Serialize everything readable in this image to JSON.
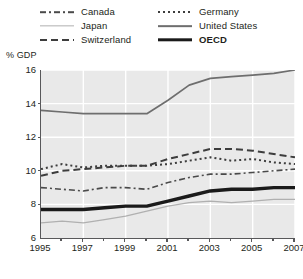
{
  "chart_data": {
    "type": "line",
    "title": "",
    "subtitle": "",
    "xlabel": "",
    "ylabel": "% GDP",
    "ylim": [
      6,
      16
    ],
    "xlim": [
      1995,
      2007
    ],
    "yticks": [
      6,
      8,
      10,
      12,
      14,
      16
    ],
    "xticks": [
      1995,
      1997,
      1999,
      2001,
      2003,
      2005,
      2007
    ],
    "xticks_minor": [
      1996,
      1998,
      2000,
      2002,
      2004,
      2006
    ],
    "grid": true,
    "grid_color": "#ffffff",
    "plot_background": "#e9e9e9",
    "axis_color": "#58585a",
    "legend_position": "top",
    "x": [
      1995,
      1996,
      1997,
      1998,
      1999,
      2000,
      2001,
      2002,
      2003,
      2004,
      2005,
      2006,
      2007
    ],
    "series": [
      {
        "name": "Canada",
        "style": "dash-dot",
        "color": "#4a4a4a",
        "width": 1.6,
        "values": [
          9.0,
          8.9,
          8.8,
          9.0,
          9.0,
          8.9,
          9.3,
          9.6,
          9.8,
          9.8,
          9.9,
          10.0,
          10.1
        ]
      },
      {
        "name": "Japan",
        "style": "solid-thin",
        "color": "#b0b0b0",
        "width": 1.3,
        "values": [
          6.9,
          7.0,
          6.9,
          7.1,
          7.3,
          7.6,
          7.9,
          8.1,
          8.2,
          8.1,
          8.2,
          8.3,
          8.3
        ]
      },
      {
        "name": "Switzerland",
        "style": "dashed",
        "color": "#3d3d3d",
        "width": 2.0,
        "values": [
          9.7,
          10.0,
          10.1,
          10.2,
          10.3,
          10.3,
          10.7,
          11.0,
          11.3,
          11.3,
          11.2,
          11.0,
          10.8
        ]
      },
      {
        "name": "Germany",
        "style": "dotted",
        "color": "#3d3d3d",
        "width": 2.0,
        "values": [
          10.1,
          10.4,
          10.2,
          10.3,
          10.3,
          10.3,
          10.4,
          10.6,
          10.8,
          10.6,
          10.7,
          10.5,
          10.4
        ]
      },
      {
        "name": "United States",
        "style": "solid",
        "color": "#6e6e6e",
        "width": 1.7,
        "values": [
          13.6,
          13.5,
          13.4,
          13.4,
          13.4,
          13.4,
          14.2,
          15.1,
          15.5,
          15.6,
          15.7,
          15.8,
          16.0
        ]
      },
      {
        "name": "OECD",
        "style": "solid-thick",
        "color": "#1a1a1a",
        "width": 3.4,
        "values": [
          7.7,
          7.7,
          7.7,
          7.8,
          7.9,
          7.9,
          8.2,
          8.5,
          8.8,
          8.9,
          8.9,
          9.0,
          9.0
        ]
      }
    ]
  },
  "legend": {
    "items": [
      {
        "label": "Canada",
        "key": "canada",
        "bold": false
      },
      {
        "label": "Germany",
        "key": "germany",
        "bold": false
      },
      {
        "label": "Japan",
        "key": "japan",
        "bold": false
      },
      {
        "label": "United States",
        "key": "unitedstates",
        "bold": false
      },
      {
        "label": "Switzerland",
        "key": "switzerland",
        "bold": false
      },
      {
        "label": "OECD",
        "key": "oecd",
        "bold": true
      }
    ]
  },
  "axes": {
    "y_title": "% GDP"
  }
}
